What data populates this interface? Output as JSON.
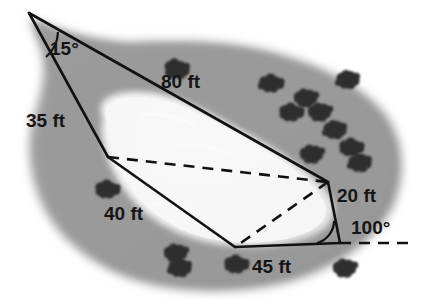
{
  "figure": {
    "background_color": "#ffffff",
    "land_color": "#9d9d9d",
    "land_shadow_color": "#8a8a8a",
    "pond_color": "#f2f2f2",
    "pond_edge_color": "#d8d8d8",
    "line_color": "#111111",
    "bush_color": "#2e2e2e"
  },
  "labels": {
    "angle_apex": "15°",
    "side_left": "35 ft",
    "side_top": "80 ft",
    "side_lower_left": "40 ft",
    "side_right": "20 ft",
    "angle_base": "100°",
    "side_bottom": "45 ft"
  },
  "geometry": {
    "vertices": {
      "apex": [
        29,
        13
      ],
      "left_mid": [
        108,
        157
      ],
      "bottom_left": [
        235,
        247
      ],
      "bottom_right": [
        340,
        243
      ],
      "right": [
        328,
        182
      ]
    },
    "solid_edges": [
      [
        [
          29,
          13
        ],
        [
          328,
          182
        ]
      ],
      [
        [
          29,
          13
        ],
        [
          108,
          157
        ]
      ],
      [
        [
          108,
          157
        ],
        [
          235,
          247
        ]
      ],
      [
        [
          235,
          247
        ],
        [
          340,
          243
        ]
      ],
      [
        [
          340,
          243
        ],
        [
          328,
          182
        ]
      ]
    ],
    "dashed_edges": [
      [
        [
          108,
          157
        ],
        [
          328,
          182
        ]
      ],
      [
        [
          328,
          182
        ],
        [
          235,
          247
        ]
      ],
      [
        [
          340,
          243
        ],
        [
          416,
          243
        ]
      ]
    ],
    "angle_marks": [
      {
        "name": "apex-15",
        "vertex": [
          29,
          13
        ],
        "value": "15°"
      },
      {
        "name": "base-100",
        "vertex": [
          340,
          243
        ],
        "value": "100°"
      }
    ]
  },
  "label_positions": {
    "angle_apex": [
      50,
      38
    ],
    "side_left": [
      26,
      110
    ],
    "side_top": [
      161,
      71
    ],
    "side_lower_left": [
      104,
      203
    ],
    "side_right": [
      337,
      185
    ],
    "angle_base": [
      351,
      217
    ],
    "side_bottom": [
      252,
      256
    ]
  },
  "bushes": [
    [
      178,
      70
    ],
    [
      272,
      84
    ],
    [
      306,
      98
    ],
    [
      348,
      80
    ],
    [
      292,
      113
    ],
    [
      320,
      112
    ],
    [
      335,
      130
    ],
    [
      352,
      148
    ],
    [
      312,
      154
    ],
    [
      360,
      163
    ],
    [
      108,
      190
    ],
    [
      176,
      253
    ],
    [
      180,
      268
    ],
    [
      237,
      265
    ],
    [
      345,
      268
    ]
  ]
}
